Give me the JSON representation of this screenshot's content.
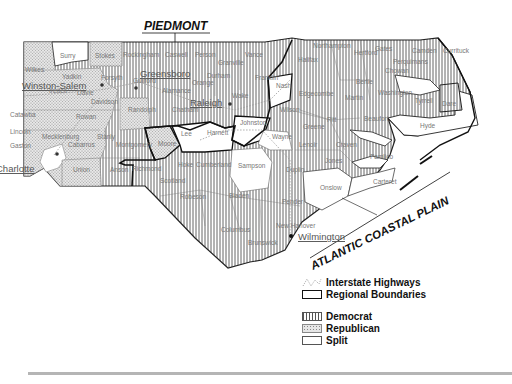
{
  "map": {
    "regions": {
      "piedmont": "PIEDMONT",
      "coastal": "ATLANTIC COASTAL PLAIN"
    },
    "cities": [
      {
        "name": "Greensboro",
        "x": 140,
        "y": 77
      },
      {
        "name": "Winston-Salem",
        "x": 22,
        "y": 89
      },
      {
        "name": "Raleigh",
        "x": 190,
        "y": 106
      },
      {
        "name": "Charlotte",
        "x": -4,
        "y": 172
      },
      {
        "name": "Wilmington",
        "x": 298,
        "y": 240
      }
    ],
    "counties": [
      {
        "name": "Surry",
        "x": 60,
        "y": 58,
        "party": "split"
      },
      {
        "name": "Stokes",
        "x": 95,
        "y": 58,
        "party": "republican"
      },
      {
        "name": "Rockingham",
        "x": 123,
        "y": 57,
        "party": "democrat"
      },
      {
        "name": "Caswell",
        "x": 165,
        "y": 57,
        "party": "democrat"
      },
      {
        "name": "Person",
        "x": 195,
        "y": 57,
        "party": "democrat"
      },
      {
        "name": "Granville",
        "x": 218,
        "y": 65,
        "party": "democrat"
      },
      {
        "name": "Vance",
        "x": 245,
        "y": 57,
        "party": "democrat"
      },
      {
        "name": "Northampton",
        "x": 313,
        "y": 48,
        "party": "democrat"
      },
      {
        "name": "Gates",
        "x": 375,
        "y": 51,
        "party": "democrat"
      },
      {
        "name": "Camden",
        "x": 412,
        "y": 53,
        "party": "democrat"
      },
      {
        "name": "Currituck",
        "x": 443,
        "y": 53,
        "party": "democrat"
      },
      {
        "name": "Hertford",
        "x": 354,
        "y": 55,
        "party": "democrat"
      },
      {
        "name": "Halifax",
        "x": 298,
        "y": 62,
        "party": "democrat"
      },
      {
        "name": "Perquimans",
        "x": 393,
        "y": 64,
        "party": "democrat"
      },
      {
        "name": "Chowan",
        "x": 385,
        "y": 73,
        "party": "democrat"
      },
      {
        "name": "Bertie",
        "x": 356,
        "y": 84,
        "party": "democrat"
      },
      {
        "name": "Nash",
        "x": 276,
        "y": 88,
        "party": "split"
      },
      {
        "name": "Edgecombe",
        "x": 299,
        "y": 96,
        "party": "democrat"
      },
      {
        "name": "Martin",
        "x": 345,
        "y": 100,
        "party": "democrat"
      },
      {
        "name": "Washington",
        "x": 378,
        "y": 95,
        "party": "democrat"
      },
      {
        "name": "Tyrrell",
        "x": 415,
        "y": 103,
        "party": "democrat"
      },
      {
        "name": "Dare",
        "x": 442,
        "y": 106,
        "party": "democrat"
      },
      {
        "name": "Wilson",
        "x": 280,
        "y": 112,
        "party": "democrat"
      },
      {
        "name": "Pitt",
        "x": 327,
        "y": 122,
        "party": "democrat"
      },
      {
        "name": "Beaufort",
        "x": 364,
        "y": 121,
        "party": "democrat"
      },
      {
        "name": "Hyde",
        "x": 420,
        "y": 128,
        "party": "democrat"
      },
      {
        "name": "Greene",
        "x": 303,
        "y": 129,
        "party": "democrat"
      },
      {
        "name": "Wayne",
        "x": 272,
        "y": 139,
        "party": "split"
      },
      {
        "name": "Lenoir",
        "x": 299,
        "y": 147,
        "party": "democrat"
      },
      {
        "name": "Craven",
        "x": 336,
        "y": 147,
        "party": "democrat"
      },
      {
        "name": "Pamlico",
        "x": 370,
        "y": 159,
        "party": "democrat"
      },
      {
        "name": "Jones",
        "x": 325,
        "y": 163,
        "party": "democrat"
      },
      {
        "name": "Onslow",
        "x": 320,
        "y": 190,
        "party": "split"
      },
      {
        "name": "Carteret",
        "x": 373,
        "y": 184,
        "party": "split"
      },
      {
        "name": "Wilkes",
        "x": 25,
        "y": 72,
        "party": "republican"
      },
      {
        "name": "Yadkin",
        "x": 62,
        "y": 79,
        "party": "republican"
      },
      {
        "name": "Forsyth",
        "x": 101,
        "y": 80,
        "party": "democrat"
      },
      {
        "name": "Guilford",
        "x": 133,
        "y": 83,
        "party": "democrat"
      },
      {
        "name": "Alamance",
        "x": 162,
        "y": 93,
        "party": "democrat"
      },
      {
        "name": "Orange",
        "x": 192,
        "y": 85,
        "party": "democrat"
      },
      {
        "name": "Durham",
        "x": 207,
        "y": 78,
        "party": "democrat"
      },
      {
        "name": "Franklin",
        "x": 255,
        "y": 80,
        "party": "democrat"
      },
      {
        "name": "Wake",
        "x": 232,
        "y": 98,
        "party": "democrat"
      },
      {
        "name": "Iredell",
        "x": 49,
        "y": 93,
        "party": "republican"
      },
      {
        "name": "Davie",
        "x": 77,
        "y": 95,
        "party": "republican"
      },
      {
        "name": "Davidson",
        "x": 91,
        "y": 104,
        "party": "republican"
      },
      {
        "name": "Randolph",
        "x": 128,
        "y": 112,
        "party": "republican"
      },
      {
        "name": "Chatham",
        "x": 172,
        "y": 112,
        "party": "democrat"
      },
      {
        "name": "Johnston",
        "x": 240,
        "y": 125,
        "party": "split"
      },
      {
        "name": "Catawba",
        "x": 10,
        "y": 117,
        "party": "republican"
      },
      {
        "name": "Rowan",
        "x": 76,
        "y": 119,
        "party": "republican"
      },
      {
        "name": "Lincoln",
        "x": 10,
        "y": 134,
        "party": "republican"
      },
      {
        "name": "Mecklenburg",
        "x": 42,
        "y": 139,
        "party": "split"
      },
      {
        "name": "Cabarrus",
        "x": 68,
        "y": 147,
        "party": "republican"
      },
      {
        "name": "Stanly",
        "x": 97,
        "y": 139,
        "party": "republican"
      },
      {
        "name": "Montgomery",
        "x": 116,
        "y": 147,
        "party": "democrat"
      },
      {
        "name": "Gaston",
        "x": 10,
        "y": 148,
        "party": "republican"
      },
      {
        "name": "Lee",
        "x": 181,
        "y": 136,
        "party": "split"
      },
      {
        "name": "Harnett",
        "x": 207,
        "y": 135,
        "party": "split"
      },
      {
        "name": "Moore",
        "x": 158,
        "y": 146,
        "party": "republican"
      },
      {
        "name": "Union",
        "x": 73,
        "y": 172,
        "party": "republican"
      },
      {
        "name": "Anson",
        "x": 110,
        "y": 172,
        "party": "democrat"
      },
      {
        "name": "Richmond",
        "x": 132,
        "y": 171,
        "party": "democrat"
      },
      {
        "name": "Hoke",
        "x": 178,
        "y": 167,
        "party": "democrat"
      },
      {
        "name": "Cumberland",
        "x": 196,
        "y": 167,
        "party": "democrat"
      },
      {
        "name": "Sampson",
        "x": 238,
        "y": 168,
        "party": "split"
      },
      {
        "name": "Duplin",
        "x": 286,
        "y": 172,
        "party": "democrat"
      },
      {
        "name": "Scotland",
        "x": 160,
        "y": 183,
        "party": "democrat"
      },
      {
        "name": "Robeson",
        "x": 180,
        "y": 199,
        "party": "democrat"
      },
      {
        "name": "Bladen",
        "x": 229,
        "y": 198,
        "party": "democrat"
      },
      {
        "name": "Pender",
        "x": 282,
        "y": 204,
        "party": "democrat"
      },
      {
        "name": "Columbus",
        "x": 221,
        "y": 232,
        "party": "democrat"
      },
      {
        "name": "New Hanover",
        "x": 276,
        "y": 228,
        "party": "democrat"
      },
      {
        "name": "Brunswick",
        "x": 248,
        "y": 245,
        "party": "democrat"
      }
    ]
  },
  "legend": {
    "highways": "Interstate Highways",
    "boundaries": "Regional Boundaries",
    "democrat": "Democrat",
    "republican": "Republican",
    "split": "Split"
  },
  "colors": {
    "democrat_hatch": "#444444",
    "republican_dots": "#9a9a9a",
    "split": "#ffffff",
    "boundary": "#111111",
    "county_line": "#666666"
  }
}
